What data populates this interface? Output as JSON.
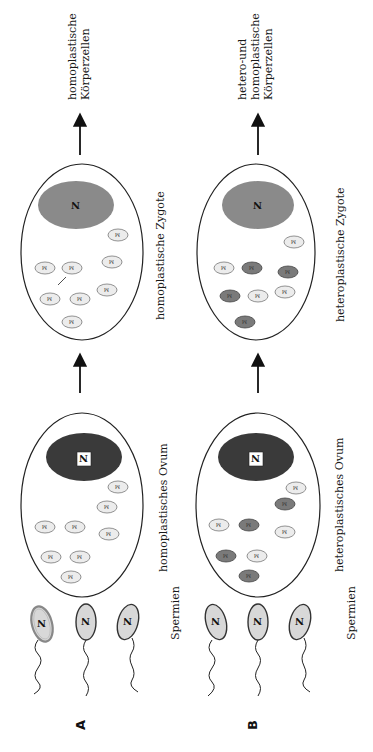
{
  "figure": {
    "orientation": "rotated-90-ccw",
    "rows": [
      {
        "id": "A",
        "label": "A",
        "sperm_label": "Spermien",
        "sperm": [
          {
            "nucleus": "N",
            "shade": "light",
            "outline": "double"
          },
          {
            "nucleus": "N",
            "shade": "light",
            "outline": "dark"
          },
          {
            "nucleus": "N",
            "shade": "light",
            "outline": "dark"
          }
        ],
        "ovum": {
          "label": "homoplastisches Ovum",
          "nucleus_label": "N",
          "nucleus_color": "#3a3a3a",
          "mitochondria_label": "M",
          "mitochondria_types": [
            "light",
            "light",
            "light",
            "light",
            "light",
            "light",
            "light",
            "light"
          ]
        },
        "zygote": {
          "label": "homoplastische Zygote",
          "nucleus_label": "N",
          "nucleus_color": "#8a8a8a",
          "mitochondria_label": "M",
          "mitochondria_types": [
            "light",
            "light",
            "light",
            "light",
            "light",
            "light",
            "light",
            "light"
          ]
        },
        "result_label_lines": [
          "homoplastische",
          "Körperzellen"
        ]
      },
      {
        "id": "B",
        "label": "B",
        "sperm_label": "Spermien",
        "sperm": [
          {
            "nucleus": "N",
            "shade": "light",
            "outline": "dark"
          },
          {
            "nucleus": "N",
            "shade": "light",
            "outline": "dark"
          },
          {
            "nucleus": "N",
            "shade": "light",
            "outline": "dark"
          }
        ],
        "ovum": {
          "label": "heteroplastisches Ovum",
          "nucleus_label": "N",
          "nucleus_color": "#3a3a3a",
          "mitochondria_label": "M",
          "mitochondria_types": [
            "light",
            "dark",
            "light",
            "dark",
            "dark",
            "light",
            "light",
            "dark"
          ]
        },
        "zygote": {
          "label": "heteroplastische Zygote",
          "nucleus_label": "N",
          "nucleus_color": "#8a8a8a",
          "mitochondria_label": "M",
          "mitochondria_types": [
            "light",
            "dark",
            "light",
            "dark",
            "dark",
            "light",
            "light",
            "dark"
          ]
        },
        "result_label_lines": [
          "hetero-und",
          "homoplastische",
          "Körperzellen"
        ]
      }
    ],
    "colors": {
      "ink": "#1a1a1a",
      "nucleus_dark": "#3a3a3a",
      "nucleus_mid": "#8a8a8a",
      "mito_light": "#ececec",
      "mito_dark": "#7a7a7a",
      "sperm_head": "#d8d8d8"
    }
  }
}
